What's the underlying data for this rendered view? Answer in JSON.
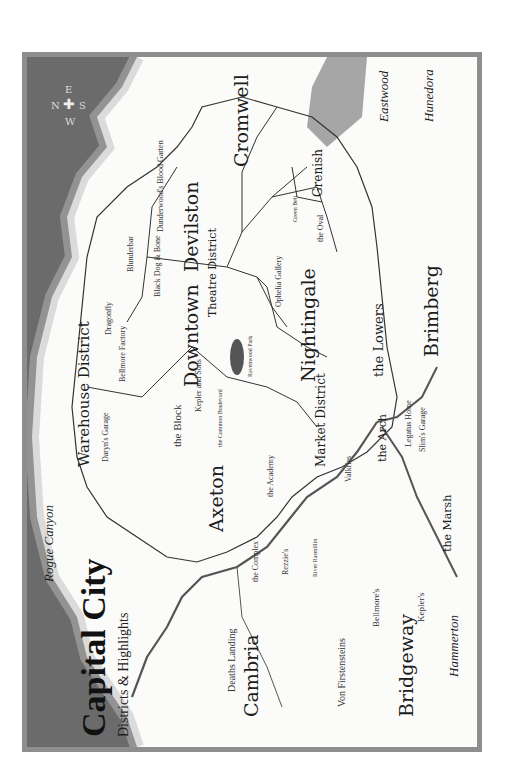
{
  "title": {
    "main": "Capital City",
    "subtitle": "Districts & Highlights"
  },
  "compass": {
    "n": "N",
    "e": "E",
    "s": "S",
    "w": "W"
  },
  "districts": [
    {
      "id": "warehouse",
      "name": "Warehouse District"
    },
    {
      "id": "downtown",
      "name": "Downtown"
    },
    {
      "id": "devilston",
      "name": "Devilston"
    },
    {
      "id": "cromwell",
      "name": "Cromwell"
    },
    {
      "id": "axeton",
      "name": "Axeton"
    },
    {
      "id": "theatre",
      "name": "Theatre District"
    },
    {
      "id": "nightingale",
      "name": "Nightingale"
    },
    {
      "id": "market",
      "name": "Market District"
    },
    {
      "id": "lowers",
      "name": "the Lowers"
    },
    {
      "id": "arch",
      "name": "the Arch"
    },
    {
      "id": "marsh",
      "name": "the Marsh"
    },
    {
      "id": "grenish",
      "name": "Grenish"
    }
  ],
  "regions": [
    {
      "id": "rogue_canyon",
      "name": "Rogue Canyon"
    },
    {
      "id": "eastwood",
      "name": "Eastwood"
    },
    {
      "id": "hunedora",
      "name": "Hunedora"
    },
    {
      "id": "brimberg",
      "name": "Brimberg"
    },
    {
      "id": "bridgeway",
      "name": "Bridgeway"
    },
    {
      "id": "cambria",
      "name": "Cambria"
    },
    {
      "id": "hammerton",
      "name": "Hammerton"
    },
    {
      "id": "deaths_landing",
      "name": "Deaths Landing"
    }
  ],
  "highlights": [
    {
      "name": "Daryn's Garage"
    },
    {
      "name": "Bellmore Factory"
    },
    {
      "name": "Dragonfly"
    },
    {
      "name": "Blunderbar"
    },
    {
      "name": "Black Dog & Bone"
    },
    {
      "name": "Dunderwood's Blood Garten"
    },
    {
      "name": "the Block"
    },
    {
      "name": "Kepler and Sons"
    },
    {
      "name": "Ravenwood Park"
    },
    {
      "name": "the Common Boulevard"
    },
    {
      "name": "Ophelia Gallery"
    },
    {
      "name": "Green Belt"
    },
    {
      "name": "the Oval"
    },
    {
      "name": "the Academy"
    },
    {
      "name": "the Complex"
    },
    {
      "name": "Rezzie's"
    },
    {
      "name": "Valkries"
    },
    {
      "name": "Legatus Home"
    },
    {
      "name": "Slim's Garage"
    },
    {
      "name": "River Rasmillin"
    },
    {
      "name": "Von Firstensteins"
    },
    {
      "name": "Bellmore's"
    },
    {
      "name": "Kepler's"
    }
  ]
}
